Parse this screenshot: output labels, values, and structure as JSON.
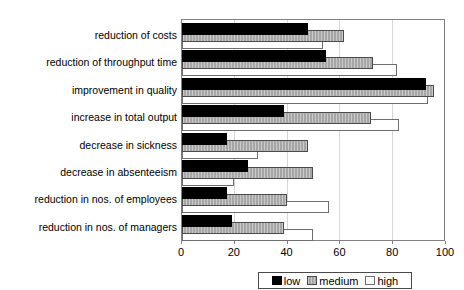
{
  "chart_data": {
    "type": "bar",
    "orientation": "horizontal",
    "title": "",
    "xlabel": "",
    "ylabel": "",
    "xlim": [
      0,
      100
    ],
    "x_ticks": [
      0,
      20,
      40,
      60,
      80,
      100
    ],
    "grid": "vertical-light-gray",
    "legend_position": "bottom-right",
    "categories": [
      "reduction of costs",
      "reduction of throughput time",
      "improvement in quality",
      "increase in total output",
      "decrease in sickness",
      "decrease in absenteeism",
      "reduction in nos. of employees",
      "reduction in nos. of managers"
    ],
    "series": [
      {
        "name": "low",
        "color": "#000000",
        "pattern": "solid-black",
        "values": [
          48,
          55,
          93,
          39,
          17,
          25,
          17,
          19
        ]
      },
      {
        "name": "medium",
        "color": "#a6a6a6",
        "pattern": "vertical-stripes",
        "values": [
          62,
          73,
          96,
          72,
          48,
          50,
          40,
          39
        ]
      },
      {
        "name": "high",
        "color": "#ffffff",
        "pattern": "white-outlined",
        "values": [
          54,
          82,
          94,
          83,
          29,
          20,
          56,
          50
        ]
      }
    ],
    "colors": {
      "plot_border": "#808080",
      "gridline": "#d6d6d6",
      "text": "#000000"
    }
  }
}
